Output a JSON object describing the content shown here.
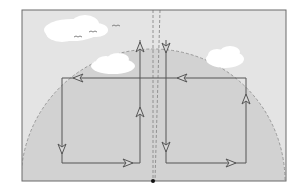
{
  "diagram": {
    "colors": {
      "page_bg": "#ffffff",
      "frame_bg": "#e4e4e4",
      "dome_fill": "#d2d2d2",
      "frame_border": "#6a6a6a",
      "line": "#555555",
      "dashed": "#999999",
      "cloud": "#ffffff",
      "dot": "#111111"
    },
    "elements": {
      "frame": "frame",
      "dome": "sky dome (dashed semicircle)",
      "clouds": [
        "cloud-left",
        "cloud-center",
        "cloud-right"
      ],
      "birds": [
        "bird",
        "bird",
        "bird"
      ],
      "center_axis": "dashed vertical center lines",
      "origin_dot": "center point",
      "left_cell": "left convection loop (counter-clockwise arrows)",
      "right_cell": "right convection loop (clockwise arrows)"
    }
  }
}
